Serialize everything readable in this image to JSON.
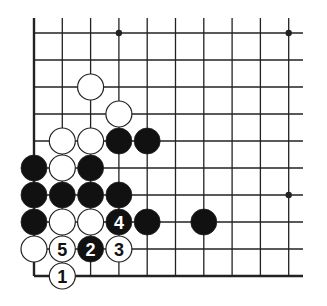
{
  "diagram": {
    "type": "go-board-corner",
    "grid": {
      "columns": 10,
      "rows": 10,
      "origin_x": 34,
      "origin_y": 33,
      "dx": 28.3,
      "dy": 27.0,
      "right_extent": 303,
      "stone_radius": 13,
      "edges": [
        "left",
        "bottom"
      ]
    },
    "hoshi": [
      {
        "col": 3,
        "row": 0
      },
      {
        "col": 9,
        "row": 0
      },
      {
        "col": 9,
        "row": 6
      }
    ],
    "stones": [
      {
        "col": 2,
        "row": 2,
        "color": "white"
      },
      {
        "col": 3,
        "row": 3,
        "color": "white"
      },
      {
        "col": 1,
        "row": 4,
        "color": "white"
      },
      {
        "col": 2,
        "row": 4,
        "color": "white"
      },
      {
        "col": 3,
        "row": 4,
        "color": "black"
      },
      {
        "col": 4,
        "row": 4,
        "color": "black"
      },
      {
        "col": 0,
        "row": 5,
        "color": "black"
      },
      {
        "col": 1,
        "row": 5,
        "color": "white"
      },
      {
        "col": 2,
        "row": 5,
        "color": "black"
      },
      {
        "col": 0,
        "row": 6,
        "color": "black"
      },
      {
        "col": 1,
        "row": 6,
        "color": "black"
      },
      {
        "col": 2,
        "row": 6,
        "color": "black"
      },
      {
        "col": 3,
        "row": 6,
        "color": "black"
      },
      {
        "col": 0,
        "row": 7,
        "color": "black"
      },
      {
        "col": 1,
        "row": 7,
        "color": "white"
      },
      {
        "col": 2,
        "row": 7,
        "color": "white"
      },
      {
        "col": 3,
        "row": 7,
        "color": "black",
        "label": "4"
      },
      {
        "col": 4,
        "row": 7,
        "color": "black"
      },
      {
        "col": 6,
        "row": 7,
        "color": "black"
      },
      {
        "col": 0,
        "row": 8,
        "color": "white"
      },
      {
        "col": 1,
        "row": 8,
        "color": "white",
        "label": "5"
      },
      {
        "col": 2,
        "row": 8,
        "color": "black",
        "label": "2"
      },
      {
        "col": 3,
        "row": 8,
        "color": "white",
        "label": "3"
      },
      {
        "col": 1,
        "row": 9,
        "color": "white",
        "label": "1"
      }
    ],
    "colors": {
      "line": "#222222",
      "black_stone": "#111111",
      "white_stone": "#ffffff",
      "background": "#ffffff"
    }
  }
}
